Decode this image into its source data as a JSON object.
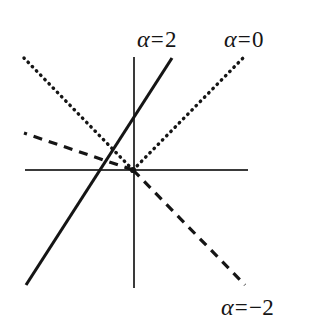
{
  "figure": {
    "background_color": "#ffffff",
    "ink_color": "#151515",
    "axis_color": "#3a3a3a",
    "width": 323,
    "height": 335
  },
  "axes": {
    "origin": {
      "x": 133,
      "y": 170
    },
    "x_axis": {
      "name": "horizontal-axis",
      "x1": 25,
      "y1": 170,
      "x2": 248,
      "y2": 170,
      "stroke_width": 1.6
    },
    "y_axis": {
      "name": "vertical-axis",
      "x1": 134,
      "y1": 57,
      "x2": 134,
      "y2": 288,
      "stroke_width": 1.6
    }
  },
  "labels": {
    "alpha_2": {
      "symbol": "α",
      "relation": "=",
      "value": "2"
    },
    "alpha_0": {
      "symbol": "α",
      "relation": "=",
      "value": "0"
    },
    "alpha_neg2": {
      "symbol": "α",
      "relation": "=",
      "value": "−2"
    }
  },
  "chart_data": {
    "type": "line",
    "title": "",
    "xlabel": "",
    "ylabel": "",
    "grid": false,
    "legend": "inline-labels-at-line-ends",
    "axis_style": "bare crossed axes, no tick marks, no tick labels",
    "xlim": [
      -1.08,
      1.12
    ],
    "ylim": [
      -1.14,
      1.1
    ],
    "series": [
      {
        "name": "alpha = 2",
        "label": "α = 2",
        "style": "solid",
        "stroke_width": 3.1,
        "color": "#151515",
        "slope_screen": -2.87,
        "points_px": [
          [
            26,
            285
          ],
          [
            133,
            170
          ],
          [
            172,
            58
          ]
        ],
        "endpoints_px": {
          "start": [
            26,
            285
          ],
          "end": [
            172,
            58
          ]
        },
        "label_position_px": [
          137,
          28
        ],
        "label_anchor": "upper-end"
      },
      {
        "name": "alpha = 0",
        "label": "α = 0",
        "style": "dotted",
        "dash_array": "0.5 5.5",
        "stroke_width": 3.4,
        "color": "#151515",
        "slope_screen": -1.02,
        "points_px": [
          [
            24,
            58
          ],
          [
            133,
            170
          ],
          [
            243,
            58
          ]
        ],
        "rays": [
          {
            "from": [
              133,
              170
            ],
            "to": [
              24,
              58
            ],
            "quadrant": "upper-left"
          },
          {
            "from": [
              133,
              170
            ],
            "to": [
              243,
              58
            ],
            "quadrant": "upper-right"
          }
        ],
        "label_position_px": [
          224,
          28
        ],
        "label_anchor": "upper-right-end"
      },
      {
        "name": "alpha = -2",
        "label": "α = −2",
        "style": "dashed",
        "dash_array": "9 7",
        "stroke_width": 3.2,
        "color": "#151515",
        "slope_screen": 1.03,
        "points_px": [
          [
            24,
            133
          ],
          [
            133,
            170
          ],
          [
            245,
            285
          ]
        ],
        "rays": [
          {
            "from": [
              133,
              170
            ],
            "to": [
              24,
              133
            ],
            "quadrant": "upper-left",
            "slope_screen": 0.34
          },
          {
            "from": [
              133,
              170
            ],
            "to": [
              245,
              285
            ],
            "quadrant": "lower-right",
            "slope_screen": 1.03
          }
        ],
        "label_position_px": [
          221,
          296
        ],
        "label_anchor": "lower-right-end"
      }
    ]
  }
}
